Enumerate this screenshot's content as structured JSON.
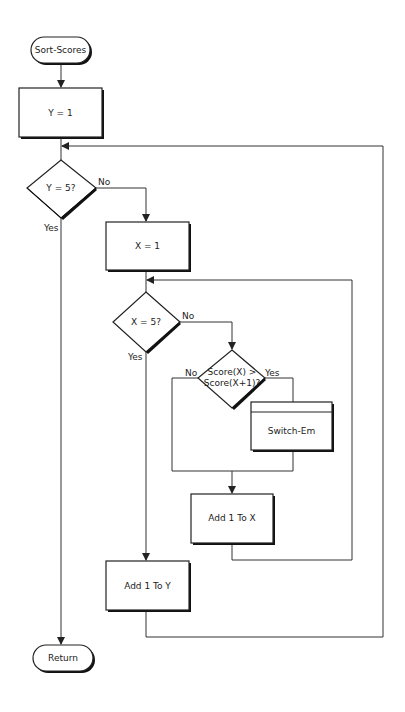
{
  "diagram": {
    "type": "flowchart",
    "title": "Sort-Scores",
    "nodes": {
      "start": {
        "label": "Sort-Scores",
        "shape": "terminal"
      },
      "init_y": {
        "label": "Y = 1",
        "shape": "process"
      },
      "check_y": {
        "label": "Y = 5?",
        "shape": "decision"
      },
      "init_x": {
        "label": "X = 1",
        "shape": "process"
      },
      "check_x": {
        "label": "X = 5?",
        "shape": "decision"
      },
      "compare": {
        "label_line1": "Score(X) >",
        "label_line2": "Score(X+1)?",
        "shape": "decision"
      },
      "switch": {
        "label": "Switch-Em",
        "shape": "predefined-process"
      },
      "inc_x": {
        "label": "Add 1 To X",
        "shape": "process"
      },
      "inc_y": {
        "label": "Add 1 To Y",
        "shape": "process"
      },
      "end": {
        "label": "Return",
        "shape": "terminal"
      }
    },
    "edges": {
      "check_y_no": "No",
      "check_y_yes": "Yes",
      "check_x_no": "No",
      "check_x_yes": "Yes",
      "compare_no": "No",
      "compare_yes": "Yes"
    }
  }
}
